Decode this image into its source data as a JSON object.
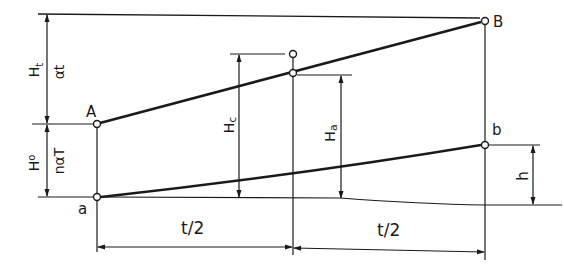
{
  "diagram": {
    "points": {
      "A": "A",
      "B": "B",
      "a": "a",
      "b": "b"
    },
    "dimensions": {
      "H_t": "H",
      "H_t_sub": "t",
      "alpha_t": "αt",
      "H_o": "H",
      "H_o_sub": "o",
      "n_alpha_T": "nαT",
      "H_c": "H",
      "H_c_sub": "c",
      "H_a": "H",
      "H_a_sub": "a",
      "h": "h",
      "half_t_left": "t/2",
      "half_t_right": "t/2"
    }
  }
}
